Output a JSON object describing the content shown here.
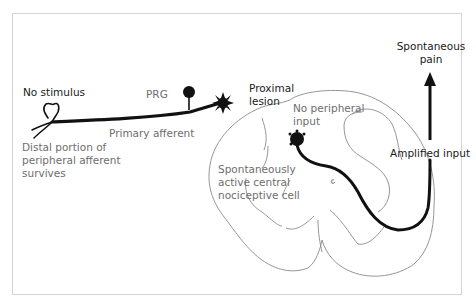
{
  "diagram": {
    "labels": {
      "no_stimulus": "No stimulus",
      "prg": "PRG",
      "primary_afferent": "Primary afferent",
      "distal_line1": "Distal portion of",
      "distal_line2": "peripheral afferent",
      "distal_line3": "survives",
      "proximal_line1": "Proximal",
      "proximal_line2": "lesion",
      "no_peripheral_line1": "No peripheral",
      "no_peripheral_line2": "input",
      "spontaneous_cell_line1": "Spontaneously",
      "spontaneous_cell_line2": "active central",
      "spontaneous_cell_line3": "nociceptive cell",
      "amplified_input": "Amplified input",
      "spontaneous_pain_line1": "Spontaneous",
      "spontaneous_pain_line2": "pain"
    },
    "colors": {
      "ink": "#111111",
      "outline": "#8a8a8a",
      "grey_text": "#6e6e6e",
      "frame": "#d4d4d4"
    }
  }
}
